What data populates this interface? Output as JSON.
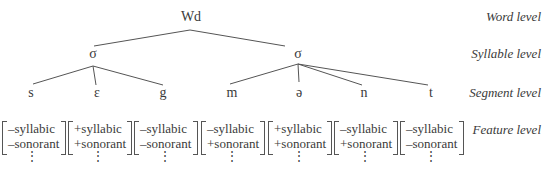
{
  "tree": {
    "root": {
      "label": "Wd"
    },
    "syllables": [
      {
        "label": "σ",
        "segments": [
          "s",
          "ɛ",
          "g"
        ]
      },
      {
        "label": "σ",
        "segments": [
          "m",
          "ə",
          "n",
          "t"
        ]
      }
    ]
  },
  "levels": {
    "word": "Word level",
    "syllable": "Syllable level",
    "segment": "Segment level",
    "feature": "Feature level"
  },
  "features": [
    {
      "segment": "s",
      "syllabic": "–syllabic",
      "sonorant": "–sonorant",
      "more": "⋮"
    },
    {
      "segment": "ɛ",
      "syllabic": "+syllabic",
      "sonorant": "+sonorant",
      "more": "⋮"
    },
    {
      "segment": "g",
      "syllabic": "–syllabic",
      "sonorant": "–sonorant",
      "more": "⋮"
    },
    {
      "segment": "m",
      "syllabic": "–syllabic",
      "sonorant": "+sonorant",
      "more": "⋮"
    },
    {
      "segment": "ə",
      "syllabic": "+syllabic",
      "sonorant": "+sonorant",
      "more": "⋮"
    },
    {
      "segment": "n",
      "syllabic": "–syllabic",
      "sonorant": "+sonorant",
      "more": "⋮"
    },
    {
      "segment": "t",
      "syllabic": "–syllabic",
      "sonorant": "–sonorant",
      "more": "⋮"
    }
  ]
}
